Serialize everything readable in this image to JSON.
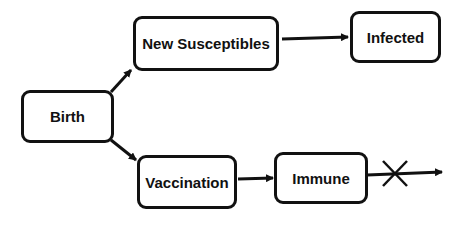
{
  "diagram": {
    "nodes": [
      {
        "id": "birth",
        "label": "Birth"
      },
      {
        "id": "new_susceptibles",
        "label": "New Susceptibles"
      },
      {
        "id": "infected",
        "label": "Infected"
      },
      {
        "id": "vaccination",
        "label": "Vaccination"
      },
      {
        "id": "immune",
        "label": "Immune"
      }
    ],
    "edges": [
      {
        "from": "birth",
        "to": "new_susceptibles"
      },
      {
        "from": "birth",
        "to": "vaccination"
      },
      {
        "from": "new_susceptibles",
        "to": "infected"
      },
      {
        "from": "vaccination",
        "to": "immune"
      },
      {
        "from": "immune",
        "to": "blocked",
        "blocked": true
      }
    ],
    "colors": {
      "stroke": "#111111",
      "background": "#ffffff"
    }
  }
}
